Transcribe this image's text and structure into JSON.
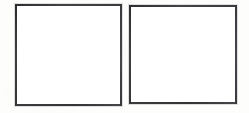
{
  "image": {
    "title": "Two empty squares",
    "description": "A scanned/white page showing two plain empty square outlines side by side",
    "width_px": 249,
    "height_px": 113,
    "background_color": "#fdfdfc"
  },
  "style": {
    "stroke_color": "#3a3a3c",
    "stroke_width_px": 2,
    "fill_color": "#ffffff"
  },
  "shapes": [
    {
      "name": "left-square",
      "type": "square",
      "label": "",
      "content": "",
      "x": 15,
      "y": 4,
      "width": 107,
      "height": 102,
      "stroke_color": "#3a3a3c",
      "fill_color": "#ffffff"
    },
    {
      "name": "right-square",
      "type": "square",
      "label": "",
      "content": "",
      "x": 129,
      "y": 5,
      "width": 108,
      "height": 99,
      "stroke_color": "#3a3a3c",
      "fill_color": "#ffffff"
    }
  ],
  "layout": {
    "gap_between_squares_px": 7,
    "left_margin_px": 15,
    "right_margin_px": 12,
    "top_margin_px": 4,
    "bottom_margin_px": 7
  }
}
